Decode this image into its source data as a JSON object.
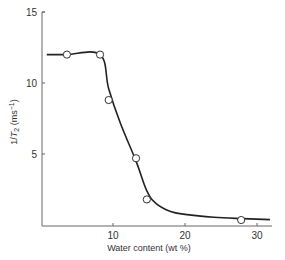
{
  "chart_data": {
    "type": "scatter",
    "title": "",
    "xlabel": "Water content (wt %)",
    "ylabel": "1/T2 (ms-1)",
    "ylabel_parts": {
      "main": "1/",
      "italic": "T",
      "sub": "2",
      "unit": "(ms",
      "sup": "−1",
      "close": ")"
    },
    "xlim": [
      0,
      32
    ],
    "ylim": [
      0,
      15
    ],
    "xticks": [
      10,
      20,
      30
    ],
    "yticks": [
      5,
      10,
      15
    ],
    "grid": false,
    "legend": null,
    "series": [
      {
        "name": "measured",
        "marker": "open-circle",
        "x": [
          3.6,
          8.2,
          9.4,
          13.2,
          14.7,
          27.8
        ],
        "y": [
          12.0,
          12.0,
          8.8,
          4.7,
          1.8,
          0.35
        ]
      },
      {
        "name": "fitted curve",
        "marker": "line",
        "x": [
          0.8,
          3.6,
          8.2,
          9.4,
          11.0,
          13.2,
          14.7,
          16.0,
          18.0,
          20.0,
          24.0,
          28.0,
          31.8
        ],
        "y": [
          12.0,
          12.0,
          12.0,
          9.6,
          7.2,
          4.5,
          2.4,
          1.5,
          0.95,
          0.75,
          0.55,
          0.45,
          0.38
        ]
      }
    ]
  },
  "axes": {
    "x_title": "Water content (wt %)",
    "y_title_main": "1/",
    "y_title_italic": "T",
    "y_title_sub": "2",
    "y_title_unit": " (ms",
    "y_title_sup": "−1",
    "y_title_close": ")",
    "x_tick_labels": [
      "10",
      "20",
      "30"
    ],
    "y_tick_labels": [
      "5",
      "10",
      "15"
    ]
  },
  "colors": {
    "line": "#222222",
    "axis": "#555555",
    "marker_fill": "#ffffff",
    "marker_stroke": "#333333"
  }
}
